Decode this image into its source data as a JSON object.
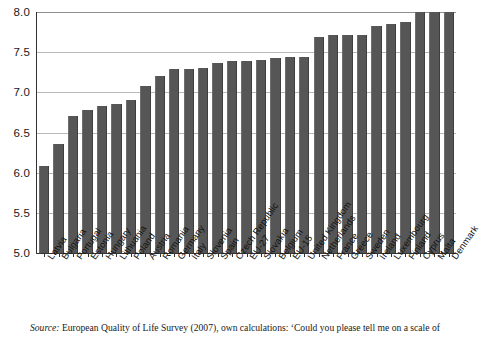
{
  "chart_data": {
    "type": "bar",
    "title": "",
    "subtitle": "",
    "xlabel": "",
    "ylabel": "",
    "ylim": [
      5.0,
      8.0
    ],
    "ytick_labels": [
      "8.0",
      "7.5",
      "7.0",
      "6.5",
      "6.0",
      "5.5",
      "5.0"
    ],
    "yticks": [
      8.0,
      7.5,
      7.0,
      6.5,
      6.0,
      5.5,
      5.0
    ],
    "grid": "horizontal",
    "legend": "none",
    "bar_color": "#565656",
    "categories": [
      "Latvia",
      "Bulgaria",
      "Portugal",
      "Estonia",
      "Hungary",
      "Lithuania",
      "Poland",
      "Austria",
      "Romania",
      "Germany",
      "Italy",
      "Slovenia",
      "Spain",
      "Czech Republic",
      "EU-27",
      "Slovakia",
      "Belgium",
      "EU-15",
      "United Kingdom",
      "Netherlands",
      "France",
      "Greece",
      "Sweden",
      "Ireland",
      "Luxembourg",
      "Finland",
      "Cyprus",
      "Malta",
      "Denmark"
    ],
    "values": [
      6.08,
      6.36,
      6.7,
      6.78,
      6.83,
      6.86,
      6.9,
      7.08,
      7.2,
      7.29,
      7.29,
      7.3,
      7.37,
      7.39,
      7.39,
      7.4,
      7.43,
      7.44,
      7.44,
      7.69,
      7.71,
      7.71,
      7.72,
      7.83,
      7.85,
      7.87,
      8.0,
      8.0,
      8.0
    ]
  },
  "source": {
    "label": "Source:",
    "text": "European Quality of Life Survey (2007), own calculations: ‘Could you please tell me on a scale of"
  }
}
